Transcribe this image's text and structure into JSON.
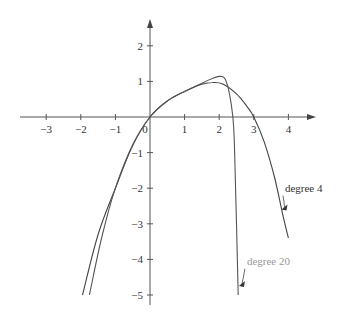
{
  "chart_data": {
    "type": "line",
    "title": "",
    "xlabel": "",
    "ylabel": "",
    "xlim": [
      -3.8,
      4.7
    ],
    "ylim": [
      -5.4,
      2.7
    ],
    "grid": false,
    "x_ticks": [
      -3,
      -2,
      -1,
      0,
      1,
      2,
      3,
      4
    ],
    "x_tick_labels": [
      "−3",
      "−2",
      "−1",
      "0",
      "1",
      "2",
      "3",
      "4"
    ],
    "y_ticks": [
      2,
      1,
      -1,
      -2,
      -3,
      -4,
      -5
    ],
    "y_tick_labels": [
      "2",
      "1",
      "−1",
      "−2",
      "−3",
      "−4",
      "−5"
    ],
    "series": [
      {
        "name": "degree 4",
        "color": "#444444",
        "label_color": "#333333",
        "points": [
          [
            -1.95,
            -5.0
          ],
          [
            -1.5,
            -3.3
          ],
          [
            -1.0,
            -2.0
          ],
          [
            -0.5,
            -0.8
          ],
          [
            0,
            0
          ],
          [
            0.5,
            0.45
          ],
          [
            1.0,
            0.72
          ],
          [
            1.5,
            0.92
          ],
          [
            1.8,
            0.97
          ],
          [
            2.1,
            0.93
          ],
          [
            2.5,
            0.65
          ],
          [
            2.8,
            0.3
          ],
          [
            3.0,
            0.0
          ],
          [
            3.3,
            -0.7
          ],
          [
            3.6,
            -1.7
          ],
          [
            3.85,
            -2.8
          ],
          [
            4.0,
            -3.4
          ]
        ],
        "annotation": {
          "text": "degree 4",
          "x": 3.9,
          "y": -2.1,
          "arrow_to": [
            3.8,
            -2.6
          ]
        }
      },
      {
        "name": "degree 20",
        "color": "#555555",
        "label_color": "#999999",
        "points": [
          [
            -1.75,
            -5.0
          ],
          [
            -1.4,
            -3.4
          ],
          [
            -1.0,
            -2.0
          ],
          [
            -0.5,
            -0.78
          ],
          [
            0,
            0
          ],
          [
            0.5,
            0.45
          ],
          [
            1.0,
            0.72
          ],
          [
            1.5,
            0.95
          ],
          [
            1.8,
            1.08
          ],
          [
            2.0,
            1.14
          ],
          [
            2.15,
            1.1
          ],
          [
            2.25,
            0.85
          ],
          [
            2.35,
            0.35
          ],
          [
            2.42,
            -0.3
          ],
          [
            2.46,
            -1.5
          ],
          [
            2.5,
            -3.0
          ],
          [
            2.55,
            -5.0
          ]
        ],
        "annotation": {
          "text": "degree 20",
          "x": 2.8,
          "y": -4.15,
          "arrow_to": [
            2.57,
            -4.75
          ]
        }
      }
    ],
    "legend": null
  }
}
